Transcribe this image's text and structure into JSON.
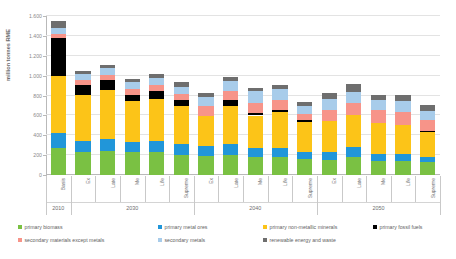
{
  "chart_data": {
    "type": "bar",
    "subtype": "stacked-column",
    "title": "",
    "xlabel": "",
    "ylabel": "million tonnes RME",
    "ylim": [
      0,
      1600
    ],
    "ytick_values": [
      0,
      200,
      400,
      600,
      800,
      1000,
      1200,
      1400,
      1600
    ],
    "ytick_labels": [
      "0",
      "200",
      "400",
      "600",
      "800",
      "1.000",
      "1.200",
      "1.400",
      "1.600"
    ],
    "grid": true,
    "legend_position": "bottom",
    "categories": [
      "Basis",
      "Ex",
      "Late",
      "Me",
      "Life",
      "Supreme",
      "Ex",
      "Late",
      "Me",
      "Life",
      "Supreme",
      "Ex",
      "Late",
      "Me",
      "Life",
      "Supreme"
    ],
    "groups": [
      {
        "label": "2010",
        "start": 0,
        "count": 1
      },
      {
        "label": "2030",
        "start": 1,
        "count": 5
      },
      {
        "label": "2040",
        "start": 6,
        "count": 5
      },
      {
        "label": "2050",
        "start": 11,
        "count": 5
      }
    ],
    "series": [
      {
        "name": "primary biomass",
        "color": "#7AC143",
        "values": [
          268,
          232,
          238,
          232,
          236,
          205,
          196,
          204,
          180,
          184,
          160,
          156,
          185,
          140,
          145,
          130
        ]
      },
      {
        "name": "primary metal ores",
        "color": "#2196D9",
        "values": [
          159,
          111,
          128,
          102,
          106,
          110,
          92,
          112,
          89,
          89,
          76,
          76,
          96,
          70,
          70,
          55
        ]
      },
      {
        "name": "primary non-metallic minerals",
        "color": "#FCC418",
        "values": [
          565,
          458,
          490,
          406,
          420,
          378,
          306,
          378,
          330,
          360,
          302,
          308,
          320,
          318,
          290,
          248
        ]
      },
      {
        "name": "primary fossil fuels",
        "color": "#000000",
        "values": [
          385,
          107,
          100,
          66,
          86,
          60,
          0,
          58,
          26,
          22,
          20,
          0,
          0,
          0,
          0,
          13
        ]
      },
      {
        "name": "secondary materials except metals",
        "color": "#F79489",
        "values": [
          46,
          48,
          52,
          56,
          56,
          60,
          96,
          98,
          104,
          102,
          60,
          116,
          128,
          130,
          128,
          106
        ]
      },
      {
        "name": "secondary metals",
        "color": "#A8CCEA",
        "values": [
          56,
          60,
          68,
          72,
          76,
          76,
          100,
          100,
          112,
          110,
          76,
          112,
          110,
          96,
          116,
          92
        ]
      },
      {
        "name": "renewable energy and waste",
        "color": "#6E6E6E",
        "values": [
          66,
          32,
          34,
          36,
          36,
          42,
          40,
          38,
          38,
          38,
          44,
          60,
          78,
          56,
          56,
          56
        ]
      }
    ]
  },
  "legend": {
    "items": [
      {
        "label": "primary biomass",
        "color": "#7AC143"
      },
      {
        "label": "primary metal ores",
        "color": "#2196D9"
      },
      {
        "label": "primary non-metallic minerals",
        "color": "#FCC418"
      },
      {
        "label": "primary fossil fuels",
        "color": "#000000"
      },
      {
        "label": "secondary materials except metals",
        "color": "#F79489"
      },
      {
        "label": "secondary metals",
        "color": "#A8CCEA"
      },
      {
        "label": "renewable energy and waste",
        "color": "#6E6E6E"
      }
    ]
  }
}
